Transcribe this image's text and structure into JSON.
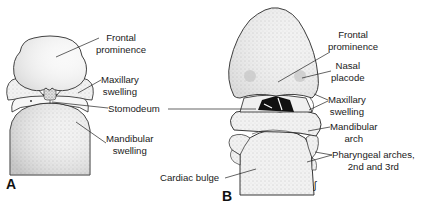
{
  "figure": {
    "panels": [
      {
        "id": "A",
        "label": "A",
        "labels": {
          "frontal_l1": "Frontal",
          "frontal_l2": "prominence",
          "maxillary_l1": "Maxillary",
          "maxillary_l2": "swelling",
          "stomodeum": "Stomodeum",
          "mandibular_l1": "Mandibular",
          "mandibular_l2": "swelling"
        }
      },
      {
        "id": "B",
        "label": "B",
        "labels": {
          "frontal_l1": "Frontal",
          "frontal_l2": "prominence",
          "nasal_l1": "Nasal",
          "nasal_l2": "placode",
          "maxillary_l1": "Maxillary",
          "maxillary_l2": "swelling",
          "mandibular_l1": "Mandibular",
          "mandibular_l2": "arch",
          "pharyngeal_l1": "Pharyngeal arches,",
          "pharyngeal_l2": "2nd and 3rd",
          "cardiac": "Cardiac bulge"
        }
      }
    ],
    "signature": "ʃ"
  }
}
